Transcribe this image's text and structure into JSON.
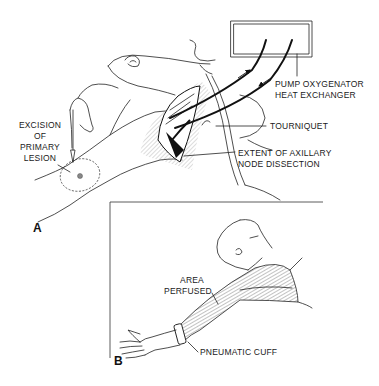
{
  "figure": {
    "panel_a": {
      "label": "A",
      "labels": {
        "pump_line1": "PUMP OXYGENATOR",
        "pump_line2": "HEAT EXCHANGER",
        "tourniquet": "TOURNIQUET",
        "extent_line1": "EXTENT OF AXILLARY",
        "extent_line2": "NODE DISSECTION",
        "excision_line1": "EXCISION",
        "excision_line2": "OF",
        "excision_line3": "PRIMARY",
        "excision_line4": "LESION"
      }
    },
    "panel_b": {
      "label": "B",
      "labels": {
        "area_line1": "AREA",
        "area_line2": "PERFUSED",
        "cuff": "PNEUMATIC CUFF"
      }
    }
  }
}
